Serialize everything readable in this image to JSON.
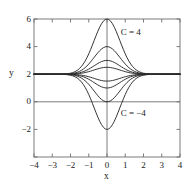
{
  "chart_data": {
    "type": "line",
    "title": "",
    "xlabel": "x",
    "ylabel": "y",
    "xlim": [
      -4,
      4
    ],
    "ylim": [
      -4,
      6
    ],
    "grid": false,
    "legend": "none",
    "xticks": [
      -4,
      -3,
      -2,
      -1,
      0,
      1,
      2,
      3,
      4
    ],
    "xtick_labels": [
      "−4",
      "−3",
      "−2",
      "−1",
      "0",
      "1",
      "2",
      "3",
      "4"
    ],
    "yticks": [
      -4,
      -2,
      0,
      2,
      4,
      6
    ],
    "ytick_labels": [
      "−4",
      "−2",
      "0",
      "2",
      "4",
      "6"
    ],
    "ytick_labels_shown": [
      "6",
      "4",
      "2",
      "0",
      "−2"
    ],
    "asymptote": 2,
    "function": "y = 2 + C e^{-x^2}",
    "annotations": [
      {
        "text": "C = 4",
        "x": 0.75,
        "y": 5.0
      },
      {
        "text": "C = −4",
        "x": 0.75,
        "y": -0.9
      }
    ],
    "series": [
      {
        "name": "C = 4",
        "C": 4,
        "peak": 6
      },
      {
        "name": "C = 2",
        "C": 2,
        "peak": 4
      },
      {
        "name": "C = 1",
        "C": 1,
        "peak": 3
      },
      {
        "name": "C = 0.5",
        "C": 0.5,
        "peak": 2.5
      },
      {
        "name": "C = −0.5",
        "C": -0.5,
        "peak": 1.5
      },
      {
        "name": "C = −1",
        "C": -1,
        "peak": 1
      },
      {
        "name": "C = −2",
        "C": -2,
        "peak": 0
      },
      {
        "name": "C = −4",
        "C": -4,
        "peak": -2
      }
    ],
    "x_samples": [
      -4,
      -3.8,
      -3.6,
      -3.4,
      -3.2,
      -3,
      -2.8,
      -2.6,
      -2.4,
      -2.2,
      -2,
      -1.9,
      -1.8,
      -1.7,
      -1.6,
      -1.5,
      -1.4,
      -1.3,
      -1.2,
      -1.1,
      -1,
      -0.9,
      -0.8,
      -0.7,
      -0.6,
      -0.5,
      -0.4,
      -0.3,
      -0.2,
      -0.1,
      0,
      0.1,
      0.2,
      0.3,
      0.4,
      0.5,
      0.6,
      0.7,
      0.8,
      0.9,
      1,
      1.1,
      1.2,
      1.3,
      1.4,
      1.5,
      1.6,
      1.7,
      1.8,
      1.9,
      2,
      2.2,
      2.4,
      2.6,
      2.8,
      3,
      3.2,
      3.4,
      3.6,
      3.8,
      4
    ]
  },
  "colors": {
    "curve": "#2b2b2b",
    "axis": "#6e6e6e",
    "frame": "#6e6e6e",
    "text": "#1a1a1a",
    "background": "#ffffff"
  },
  "geometry": {
    "left": 34,
    "right": 180,
    "top": 19,
    "bottom": 157
  }
}
